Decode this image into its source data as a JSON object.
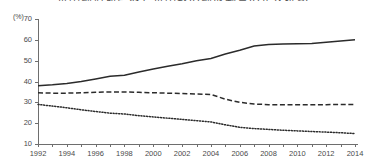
{
  "chart_data": {
    "type": "line",
    "title": "世帯構造別にみた世帯数の構成割合の年次推移",
    "ylabel": "(%)",
    "xlabel": "",
    "ylim": [
      10,
      70
    ],
    "yticks": [
      10,
      20,
      30,
      40,
      50,
      60,
      70
    ],
    "grid": false,
    "legend": "none",
    "x": [
      1992,
      1993,
      1994,
      1995,
      1996,
      1997,
      1998,
      1999,
      2000,
      2001,
      2002,
      2003,
      2004,
      2005,
      2006,
      2007,
      2008,
      2009,
      2010,
      2011,
      2012,
      2013,
      2014
    ],
    "xtick_labels": [
      "1992",
      "1994",
      "1996",
      "1998",
      "2000",
      "2002",
      "2004",
      "2006",
      "2008",
      "2010",
      "2012",
      "2014"
    ],
    "xtick_years": [
      1992,
      1994,
      1996,
      1998,
      2000,
      2002,
      2004,
      2006,
      2008,
      2010,
      2012,
      2014
    ],
    "series": [
      {
        "name": "solid-line-series",
        "style": "solid",
        "color": "#2b2b2b",
        "values": [
          38.0,
          38.4,
          39.0,
          40.0,
          41.2,
          42.5,
          43.0,
          44.6,
          46.0,
          47.3,
          48.5,
          50.0,
          51.0,
          53.2,
          55.0,
          57.0,
          57.8,
          58.0,
          58.1,
          58.3,
          58.9,
          59.4,
          60.0
        ]
      },
      {
        "name": "dashed-line-series",
        "style": "dashed",
        "color": "#2b2b2b",
        "values": [
          34.6,
          34.4,
          34.4,
          34.6,
          34.8,
          35.0,
          35.0,
          34.8,
          34.6,
          34.4,
          34.2,
          34.0,
          33.8,
          31.5,
          30.0,
          29.2,
          28.9,
          28.8,
          28.8,
          28.8,
          28.9,
          29.0,
          29.0
        ]
      },
      {
        "name": "dotted-line-series",
        "style": "dotted",
        "color": "#2b2b2b",
        "values": [
          29.0,
          28.2,
          27.4,
          26.4,
          25.6,
          24.8,
          24.4,
          23.6,
          23.0,
          22.4,
          21.8,
          21.2,
          20.6,
          19.2,
          18.0,
          17.4,
          17.0,
          16.6,
          16.3,
          16.0,
          15.7,
          15.4,
          15.0
        ]
      }
    ]
  },
  "axes": {
    "unit_label": "(%)"
  }
}
